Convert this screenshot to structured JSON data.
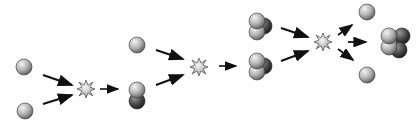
{
  "diagram": {
    "type": "nuclear-fusion-chain",
    "stages": [
      {
        "reactants": [
          "proton",
          "proton"
        ],
        "event": "fusion-flash",
        "products": [
          "deuteron"
        ]
      },
      {
        "reactants": [
          "proton",
          "deuteron"
        ],
        "event": "fusion-flash",
        "products": [
          "helium-3"
        ]
      },
      {
        "reactants": [
          "helium-3",
          "helium-3"
        ],
        "event": "fusion-flash",
        "products": [
          "proton",
          "helium-4",
          "proton"
        ]
      }
    ],
    "colors": {
      "proton_light": "#e8e8e8",
      "proton_dark": "#6e6e6e",
      "neutron_light": "#8a8a8a",
      "neutron_dark": "#222222",
      "arrow": "#111111",
      "flash_fill": "#d9d9d9",
      "flash_stroke": "#333333",
      "background": "#ffffff"
    }
  }
}
